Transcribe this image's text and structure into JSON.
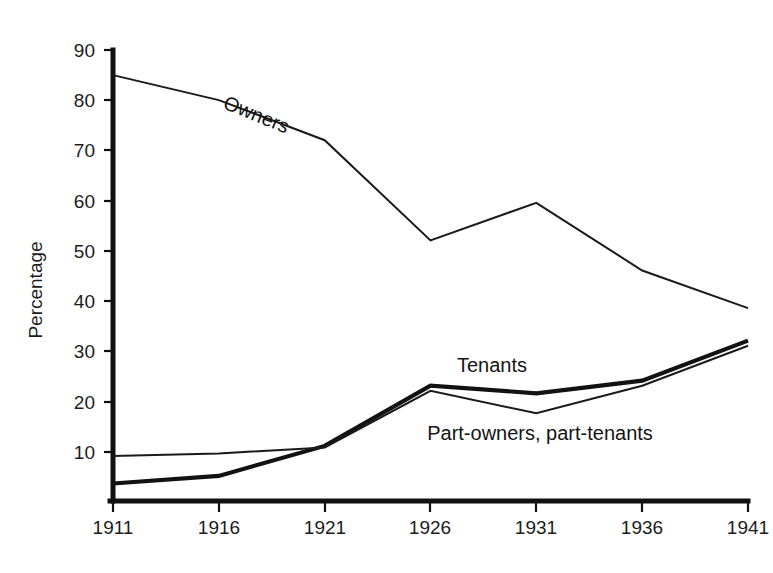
{
  "chart_data": {
    "type": "line",
    "title": "",
    "subtitle": "",
    "xlabel": "",
    "ylabel": "Percentage",
    "categories": [
      "1911",
      "1916",
      "1921",
      "1926",
      "1931",
      "1936",
      "1941"
    ],
    "x": [
      1911,
      1916,
      1921,
      1926,
      1931,
      1936,
      1941
    ],
    "xlim": [
      1911,
      1941
    ],
    "ylim": [
      0,
      90
    ],
    "y_ticks": [
      10,
      20,
      30,
      40,
      50,
      60,
      70,
      80,
      90
    ],
    "x_ticks": [
      "1911",
      "1916",
      "1921",
      "1926",
      "1931",
      "1936",
      "1941"
    ],
    "grid": false,
    "legend": "inline-annotations",
    "series": [
      {
        "name": "Owners",
        "style": "thin",
        "label_rotated": true,
        "values": [
          85,
          80,
          72,
          52,
          59.5,
          46,
          38.5
        ]
      },
      {
        "name": "Tenants",
        "style": "thick",
        "label_rotated": false,
        "values": [
          3.5,
          5,
          11,
          23,
          21.5,
          24,
          32
        ]
      },
      {
        "name": "Part-owners, part-tenants",
        "style": "thin",
        "label_rotated": false,
        "values": [
          9,
          9.5,
          10.7,
          22,
          17.5,
          23,
          31
        ]
      }
    ],
    "annotations": [
      {
        "text": "Owners",
        "series": "Owners"
      },
      {
        "text": "Tenants",
        "series": "Tenants"
      },
      {
        "text": "Part-owners, part-tenants",
        "series": "Part-owners, part-tenants"
      }
    ]
  },
  "axis": {
    "y_title": "Percentage",
    "y_tick_labels": [
      "90",
      "80",
      "70",
      "60",
      "50",
      "40",
      "30",
      "20",
      "10"
    ],
    "x_tick_labels": [
      "1911",
      "1916",
      "1921",
      "1926",
      "1931",
      "1936",
      "1941"
    ]
  },
  "labels": {
    "owners": "Owners",
    "tenants": "Tenants",
    "part_owners": "Part-owners, part-tenants"
  },
  "colors": {
    "ink": "#1a1a1a",
    "background": "#ffffff"
  }
}
